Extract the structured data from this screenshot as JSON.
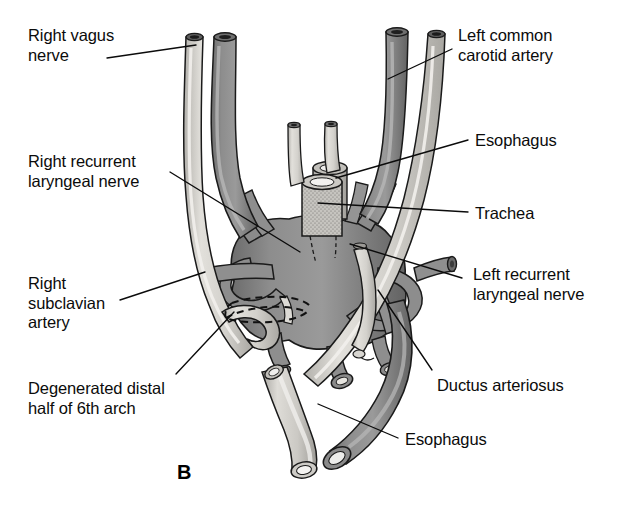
{
  "figure": {
    "panel_letter": "B",
    "caption_title": "Derivatives of the aortic arches — later stage",
    "background_color": "#ffffff",
    "line_color": "#0b0b0b"
  },
  "palette": {
    "aorta_fill": "#8a8a8a",
    "aorta_shade": "#6d6d6d",
    "aorta_highlight": "#b9b9b9",
    "nerve_fill": "#d4d2cd",
    "nerve_shade": "#aeaca7",
    "esophagus_fill": "#c9c7c2",
    "trachea_fill": "#bdbbb6",
    "outline": "#1a1a1a",
    "lumen_dark": "#2a2a2a",
    "white": "#ffffff"
  },
  "labels": [
    {
      "id": "right-vagus-nerve",
      "text_lines": [
        "Right vagus",
        "nerve"
      ],
      "x": 28,
      "y": 26,
      "leader": [
        [
          107,
          58
        ],
        [
          196,
          45
        ]
      ]
    },
    {
      "id": "right-recurrent-laryngeal-nerve",
      "text_lines": [
        "Right recurrent",
        "laryngeal nerve"
      ],
      "x": 28,
      "y": 152,
      "leader": [
        [
          170,
          172
        ],
        [
          300,
          252
        ]
      ]
    },
    {
      "id": "right-subclavian-artery",
      "text_lines": [
        "Right",
        "subclavian",
        "artery"
      ],
      "x": 28,
      "y": 274,
      "leader": [
        [
          120,
          300
        ],
        [
          205,
          272
        ]
      ]
    },
    {
      "id": "degenerated-distal-half-of-6th-arch",
      "text_lines": [
        "Degenerated distal",
        "half of 6th arch"
      ],
      "x": 28,
      "y": 379,
      "leader": [
        [
          176,
          374
        ],
        [
          234,
          312
        ]
      ]
    },
    {
      "id": "left-common-carotid-artery",
      "text_lines": [
        "Left common",
        "carotid artery"
      ],
      "x": 458,
      "y": 26,
      "leader": [
        [
          452,
          49
        ],
        [
          388,
          79
        ]
      ]
    },
    {
      "id": "esophagus-upper",
      "text_lines": [
        "Esophagus"
      ],
      "x": 475,
      "y": 131,
      "leader": [
        [
          468,
          140
        ],
        [
          336,
          178
        ]
      ]
    },
    {
      "id": "trachea",
      "text_lines": [
        "Trachea"
      ],
      "x": 475,
      "y": 204,
      "leader": [
        [
          468,
          212
        ],
        [
          318,
          203
        ]
      ]
    },
    {
      "id": "left-recurrent-laryngeal-nerve",
      "text_lines": [
        "Left recurrent",
        "laryngeal nerve"
      ],
      "x": 473,
      "y": 265,
      "leader": [
        [
          462,
          278
        ],
        [
          350,
          244
        ]
      ]
    },
    {
      "id": "ductus-arteriosus",
      "text_lines": [
        "Ductus arteriosus"
      ],
      "x": 437,
      "y": 376,
      "leader": [
        [
          432,
          370
        ],
        [
          378,
          290
        ]
      ]
    },
    {
      "id": "esophagus-lower",
      "text_lines": [
        "Esophagus"
      ],
      "x": 405,
      "y": 430,
      "leader": [
        [
          398,
          438
        ],
        [
          318,
          404
        ]
      ]
    }
  ],
  "structures": [
    {
      "id": "right-vagus-nerve-tube",
      "kind": "nerve",
      "description": "Long pale nerve descending on the right side"
    },
    {
      "id": "right-common-carotid-artery-tube",
      "kind": "artery",
      "description": "Right common carotid artery ascending"
    },
    {
      "id": "left-common-carotid-artery-tube",
      "kind": "artery",
      "description": "Left common carotid artery ascending"
    },
    {
      "id": "left-vagus-nerve-tube",
      "kind": "nerve",
      "description": "Left vagus nerve descending over the arch"
    },
    {
      "id": "trachea-cylinder",
      "kind": "trachea",
      "description": "Stippled trachea cylinder in the midline"
    },
    {
      "id": "esophagus-upper-cylinder",
      "kind": "esophagus",
      "description": "Esophagus behind trachea"
    },
    {
      "id": "aortic-arch-body",
      "kind": "artery",
      "description": "Central aortic sac / arch derivatives"
    },
    {
      "id": "right-subclavian-artery-tube",
      "kind": "artery",
      "description": "Right subclavian artery projecting left"
    },
    {
      "id": "left-subclavian-artery-tube",
      "kind": "artery",
      "description": "Left subclavian artery projecting right"
    },
    {
      "id": "ductus-arteriosus-tube",
      "kind": "artery",
      "description": "Ductus arteriosus connecting 6th arch to dorsal aorta"
    },
    {
      "id": "pulmonary-arteries",
      "kind": "artery",
      "description": "Paired pulmonary artery stumps"
    },
    {
      "id": "descending-aorta-tube",
      "kind": "artery",
      "description": "Descending aorta"
    },
    {
      "id": "esophagus-lower-tube",
      "kind": "esophagus",
      "description": "Esophagus descending below the arch"
    },
    {
      "id": "degenerated-6th-arch-outline",
      "kind": "dashed-outline",
      "description": "Dashed outline of degenerated distal right 6th arch"
    },
    {
      "id": "right-recurrent-laryngeal-nerve-tube",
      "kind": "nerve",
      "description": "Right recurrent laryngeal nerve hooking under subclavian"
    },
    {
      "id": "left-recurrent-laryngeal-nerve-tube",
      "kind": "nerve",
      "description": "Left recurrent laryngeal nerve hooking under ductus"
    }
  ]
}
